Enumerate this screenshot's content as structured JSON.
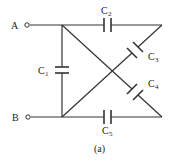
{
  "diagram": {
    "type": "capacitor-circuit",
    "caption": "(a)",
    "terminals": [
      {
        "id": "A",
        "label": "A"
      },
      {
        "id": "B",
        "label": "B"
      }
    ],
    "capacitors": [
      {
        "id": "C1",
        "letter": "C",
        "sub": "1"
      },
      {
        "id": "C2",
        "letter": "C",
        "sub": "2"
      },
      {
        "id": "C3",
        "letter": "C",
        "sub": "3"
      },
      {
        "id": "C4",
        "letter": "C",
        "sub": "4"
      },
      {
        "id": "C5",
        "letter": "C",
        "sub": "5"
      }
    ],
    "colors": {
      "line": "#333333",
      "background": "#ffffff"
    }
  }
}
